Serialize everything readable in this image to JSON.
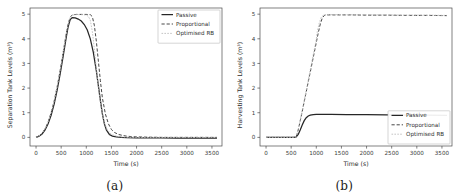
{
  "figure": {
    "panels": [
      {
        "caption": "(a)",
        "name": "separation-tank-panel"
      },
      {
        "caption": "(b)",
        "name": "harvesting-tank-panel"
      }
    ]
  },
  "chart_data": [
    {
      "type": "line",
      "title": "",
      "xlabel": "Time (s)",
      "ylabel": "Separation Tank Levels (m³)",
      "xlim": [
        -120,
        3700
      ],
      "ylim": [
        -0.35,
        5.25
      ],
      "xticks": [
        0,
        500,
        1000,
        1500,
        2000,
        2500,
        3000,
        3500
      ],
      "xticklabels": [
        "0",
        "500",
        "1000",
        "1500",
        "2000",
        "2500",
        "3000",
        "3500"
      ],
      "yticks": [
        0,
        1,
        2,
        3,
        4,
        5
      ],
      "yticklabels": [
        "0",
        "1",
        "2",
        "3",
        "4",
        "5"
      ],
      "grid": false,
      "legend_position": "upper right",
      "legend": [
        "Passive",
        "Proportional",
        "Optimised RB"
      ],
      "series": [
        {
          "name": "Passive",
          "style": "solid",
          "color": "#262626",
          "x": [
            0,
            60,
            120,
            180,
            240,
            300,
            360,
            420,
            480,
            540,
            600,
            640,
            680,
            720,
            780,
            840,
            900,
            960,
            1020,
            1080,
            1140,
            1200,
            1240,
            1280,
            1320,
            1360,
            1400,
            1460,
            1520,
            1600,
            1700,
            1800,
            2000,
            2200,
            2500,
            2800,
            3100,
            3400,
            3600
          ],
          "y": [
            0.0,
            0.05,
            0.14,
            0.3,
            0.55,
            0.9,
            1.35,
            1.92,
            2.58,
            3.3,
            4.05,
            4.5,
            4.78,
            4.86,
            4.85,
            4.8,
            4.72,
            4.58,
            4.36,
            4.0,
            3.45,
            2.7,
            2.1,
            1.5,
            0.95,
            0.55,
            0.3,
            0.12,
            0.05,
            0.02,
            0.0,
            -0.01,
            -0.02,
            -0.02,
            -0.02,
            -0.03,
            -0.03,
            -0.03,
            -0.03
          ]
        },
        {
          "name": "Proportional",
          "style": "dashed",
          "color": "#3d3d3d",
          "x": [
            0,
            60,
            120,
            180,
            240,
            300,
            360,
            420,
            480,
            540,
            600,
            640,
            680,
            720,
            800,
            900,
            1000,
            1080,
            1120,
            1160,
            1200,
            1240,
            1280,
            1320,
            1380,
            1440,
            1500,
            1560,
            1640,
            1720,
            1800,
            1900,
            2000,
            2200,
            2500,
            2800,
            3100,
            3400,
            3600
          ],
          "y": [
            0.0,
            0.06,
            0.17,
            0.35,
            0.62,
            1.0,
            1.47,
            2.05,
            2.72,
            3.45,
            4.2,
            4.62,
            4.88,
            4.97,
            4.99,
            4.99,
            4.99,
            4.98,
            4.9,
            4.55,
            3.9,
            3.1,
            2.3,
            1.6,
            0.95,
            0.55,
            0.32,
            0.2,
            0.12,
            0.08,
            0.05,
            0.03,
            0.02,
            0.01,
            0.0,
            0.0,
            0.0,
            0.0,
            0.0
          ]
        },
        {
          "name": "Optimised RB",
          "style": "dotted",
          "color": "#bdbdbd",
          "x": [
            0,
            60,
            120,
            180,
            240,
            300,
            360,
            420,
            480,
            540,
            600,
            640,
            680,
            720,
            800,
            900,
            980,
            1040,
            1080,
            1120,
            1160,
            1200,
            1240,
            1300,
            1360,
            1420,
            1500,
            1600,
            1700,
            1800,
            2000,
            2300,
            2600,
            3000,
            3400,
            3600
          ],
          "y": [
            0.0,
            0.06,
            0.17,
            0.35,
            0.62,
            1.0,
            1.47,
            2.05,
            2.72,
            3.45,
            4.2,
            4.62,
            4.88,
            4.96,
            4.98,
            4.98,
            4.97,
            4.92,
            4.75,
            4.3,
            3.6,
            2.8,
            2.0,
            1.15,
            0.6,
            0.3,
            0.12,
            0.05,
            0.02,
            0.01,
            0.0,
            0.0,
            0.0,
            0.0,
            0.0,
            0.0
          ]
        }
      ]
    },
    {
      "type": "line",
      "title": "",
      "xlabel": "Time (s)",
      "ylabel": "Harvesting Tank Levels (m³)",
      "xlim": [
        -120,
        3700
      ],
      "ylim": [
        -0.35,
        5.25
      ],
      "xticks": [
        0,
        500,
        1000,
        1500,
        2000,
        2500,
        3000,
        3500
      ],
      "xticklabels": [
        "0",
        "500",
        "1000",
        "1500",
        "2000",
        "2500",
        "3000",
        "3500"
      ],
      "yticks": [
        0,
        1,
        2,
        3,
        4,
        5
      ],
      "yticklabels": [
        "0",
        "1",
        "2",
        "3",
        "4",
        "5"
      ],
      "grid": false,
      "legend_position": "lower right",
      "legend": [
        "Passive",
        "Proportional",
        "Optimised RB"
      ],
      "series": [
        {
          "name": "Passive",
          "style": "solid",
          "color": "#262626",
          "x": [
            0,
            200,
            400,
            560,
            600,
            640,
            680,
            720,
            760,
            800,
            840,
            880,
            940,
            1000,
            1100,
            1300,
            1600,
            2000,
            2400,
            2800,
            3200,
            3600
          ],
          "y": [
            0.0,
            0.0,
            0.0,
            0.0,
            0.02,
            0.12,
            0.3,
            0.5,
            0.68,
            0.8,
            0.87,
            0.9,
            0.92,
            0.93,
            0.93,
            0.93,
            0.92,
            0.92,
            0.91,
            0.9,
            0.9,
            0.89
          ]
        },
        {
          "name": "Proportional",
          "style": "dashed",
          "color": "#3d3d3d",
          "x": [
            0,
            200,
            400,
            560,
            600,
            640,
            700,
            760,
            820,
            880,
            940,
            1000,
            1040,
            1080,
            1120,
            1160,
            1200,
            1400,
            1700,
            2000,
            2400,
            2800,
            3200,
            3600
          ],
          "y": [
            0.0,
            0.0,
            0.0,
            0.0,
            0.03,
            0.3,
            0.85,
            1.45,
            2.05,
            2.65,
            3.25,
            3.85,
            4.25,
            4.6,
            4.85,
            4.95,
            4.97,
            4.97,
            4.97,
            4.96,
            4.96,
            4.95,
            4.95,
            4.94
          ]
        },
        {
          "name": "Optimised RB",
          "style": "dotted",
          "color": "#bdbdbd",
          "x": [
            0,
            200,
            400,
            560,
            600,
            640,
            700,
            760,
            820,
            880,
            940,
            1000,
            1020,
            1060,
            1100,
            1140,
            1200,
            1500,
            1900,
            2300,
            2800,
            3200,
            3600
          ],
          "y": [
            0.0,
            0.0,
            0.0,
            0.0,
            0.03,
            0.32,
            0.9,
            1.5,
            2.12,
            2.74,
            3.36,
            3.98,
            4.3,
            4.65,
            4.88,
            4.96,
            4.98,
            4.98,
            4.97,
            4.97,
            4.96,
            4.96,
            4.95
          ]
        }
      ]
    }
  ]
}
